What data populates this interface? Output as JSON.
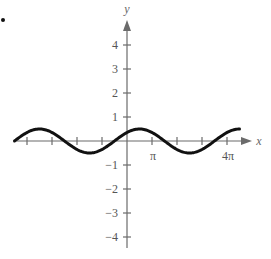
{
  "chart_data": {
    "type": "line",
    "title": "",
    "xlabel": "x",
    "ylabel": "y",
    "function": "y = 0.5 sin(x/2 + π/4)",
    "xlim": [
      -14.137,
      14.137
    ],
    "ylim": [
      -4.5,
      4.8
    ],
    "x_tick_step": "π",
    "x_tick_positions": [
      -4,
      -3,
      -2,
      -1,
      1,
      2,
      3,
      4
    ],
    "x_tick_labels": [
      {
        "at": 1,
        "label": "π"
      },
      {
        "at": 4,
        "label": "4π"
      }
    ],
    "y_ticks": [
      -4,
      -3,
      -2,
      -1,
      1,
      2,
      3,
      4
    ],
    "y_tick_labels": [
      "−4",
      "−3",
      "−2",
      "−1",
      "1",
      "2",
      "3",
      "4"
    ],
    "amplitude": 0.5,
    "period": "4π",
    "series": [
      {
        "name": "curve",
        "x_in_pi": [
          -4.5,
          -4,
          -3.5,
          -3,
          -2.5,
          -2,
          -1.5,
          -1,
          -0.5,
          0,
          0.5,
          1,
          1.5,
          2,
          2.5,
          3,
          3.5,
          4,
          4.5
        ],
        "y": [
          0,
          0.35,
          0.5,
          0.35,
          0,
          -0.35,
          -0.5,
          -0.35,
          0,
          0.35,
          0.5,
          0.35,
          0,
          -0.35,
          -0.5,
          -0.35,
          0,
          0.35,
          0.5
        ]
      }
    ],
    "grid": false,
    "legend": null
  },
  "labels": {
    "x_axis": "x",
    "y_axis": "y",
    "pi": "π",
    "four_pi": "4π",
    "y4": "4",
    "y3": "3",
    "y2": "2",
    "y1": "1",
    "ym1": "−1",
    "ym2": "−2",
    "ym3": "−3",
    "ym4": "−4"
  }
}
